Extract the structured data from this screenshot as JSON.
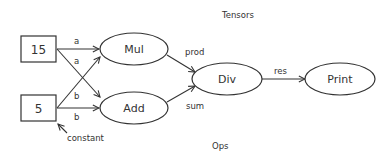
{
  "diagram": {
    "section_labels": {
      "top": "Tensors",
      "bottom": "Ops"
    },
    "nodes": [
      {
        "id": "n15",
        "label": "15",
        "shape": "rect"
      },
      {
        "id": "n5",
        "label": "5",
        "shape": "rect"
      },
      {
        "id": "mul",
        "label": "Mul",
        "shape": "ellipse"
      },
      {
        "id": "add",
        "label": "Add",
        "shape": "ellipse"
      },
      {
        "id": "div",
        "label": "Div",
        "shape": "ellipse"
      },
      {
        "id": "print",
        "label": "Print",
        "shape": "ellipse"
      }
    ],
    "edges": [
      {
        "from": "n15",
        "to": "mul",
        "label": "a"
      },
      {
        "from": "n15",
        "to": "add",
        "label": "a"
      },
      {
        "from": "n5",
        "to": "mul",
        "label": "b"
      },
      {
        "from": "n5",
        "to": "add",
        "label": "b"
      },
      {
        "from": "mul",
        "to": "div",
        "label": "prod"
      },
      {
        "from": "add",
        "to": "div",
        "label": "sum"
      },
      {
        "from": "div",
        "to": "print",
        "label": "res"
      }
    ],
    "annotation": {
      "label": "constant",
      "target": "n5"
    }
  }
}
